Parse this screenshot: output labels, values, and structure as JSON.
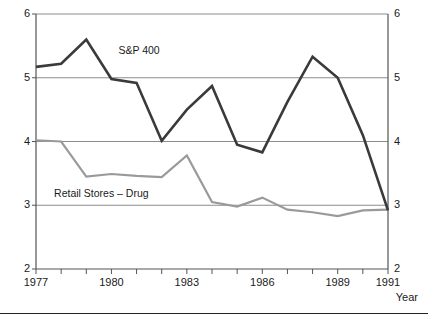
{
  "chart_data": {
    "type": "line",
    "title": "",
    "xlabel": "Year",
    "ylabel": "",
    "x": [
      1977,
      1978,
      1979,
      1980,
      1981,
      1982,
      1983,
      1984,
      1985,
      1986,
      1987,
      1988,
      1989,
      1990,
      1991
    ],
    "xlim": [
      1977,
      1991
    ],
    "ylim": [
      2,
      6
    ],
    "y_ticks": [
      2,
      3,
      4,
      5,
      6
    ],
    "y_tick_labels_left": [
      "2",
      "3",
      "4",
      "5",
      "6"
    ],
    "y_tick_labels_right": [
      "2",
      "3",
      "4",
      "5",
      "6"
    ],
    "x_tick_labels": [
      "1977",
      "1980",
      "1983",
      "1986",
      "1989",
      "1991"
    ],
    "x_tick_label_years": [
      1977,
      1980,
      1983,
      1986,
      1989,
      1991
    ],
    "grid": "horizontal",
    "legend_position": "inline-annotation",
    "series": [
      {
        "name": "S&P 400",
        "color": "#3a3a3a",
        "values": [
          5.17,
          5.22,
          5.6,
          4.98,
          4.92,
          4.01,
          4.5,
          4.87,
          3.95,
          3.83,
          4.62,
          5.33,
          5.0,
          4.1,
          2.92
        ]
      },
      {
        "name": "Retail Stores – Drug",
        "color": "#9a9a9a",
        "values": [
          4.02,
          4.0,
          3.45,
          3.49,
          3.46,
          3.44,
          3.78,
          3.05,
          2.98,
          3.12,
          2.93,
          2.89,
          2.83,
          2.92,
          2.93
        ]
      }
    ],
    "annotations": [
      {
        "text": "S&P 400",
        "x": 1981.1,
        "y": 5.42
      },
      {
        "text": "Retail Stores – Drug",
        "x": 1979.6,
        "y": 3.17
      }
    ]
  },
  "axis": {
    "x_title": "Year"
  }
}
